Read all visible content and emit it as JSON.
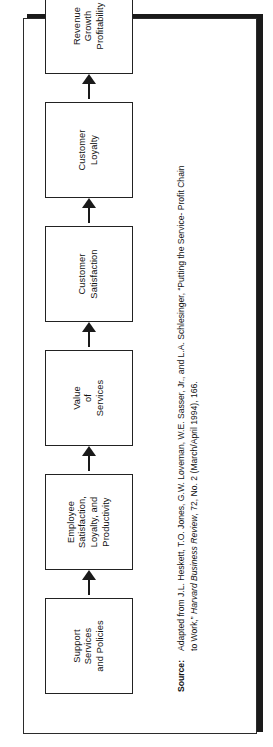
{
  "figure": {
    "orientation": "rotated-90-ccw",
    "frame_border_color": "#2b2b2b",
    "shadow_color": "#1a1a1a",
    "box_border_color": "#222222",
    "arrow_color": "#1a1a1a",
    "background": "#ffffff"
  },
  "diagram": {
    "type": "flow-chain",
    "nodes": [
      {
        "id": "support-services-and-policies",
        "lines": [
          "Support",
          "Services",
          "and Policies"
        ]
      },
      {
        "id": "employee-satisfaction-loyalty-productivity",
        "lines": [
          "Employee",
          "Satisfaction,",
          "Loyalty, and",
          "Productivity"
        ]
      },
      {
        "id": "value-of-services",
        "lines": [
          "Value",
          "of",
          "Services"
        ]
      },
      {
        "id": "customer-satisfaction",
        "lines": [
          "Customer",
          "Satisfaction"
        ]
      },
      {
        "id": "customer-loyalty",
        "lines": [
          "Customer",
          "Loyalty"
        ]
      },
      {
        "id": "revenue-growth-profitability",
        "lines": [
          "Revenue",
          "Growth",
          "Profitability"
        ]
      }
    ],
    "connectors": [
      {
        "from": "support-services-and-policies",
        "to": "employee-satisfaction-loyalty-productivity",
        "glyph": "arrow-right-icon"
      },
      {
        "from": "employee-satisfaction-loyalty-productivity",
        "to": "value-of-services",
        "glyph": "arrow-right-icon"
      },
      {
        "from": "value-of-services",
        "to": "customer-satisfaction",
        "glyph": "arrow-right-icon"
      },
      {
        "from": "customer-satisfaction",
        "to": "customer-loyalty",
        "glyph": "arrow-right-icon"
      },
      {
        "from": "customer-loyalty",
        "to": "revenue-growth-profitability",
        "glyph": "arrow-right-icon"
      }
    ]
  },
  "source": {
    "label": "Source:",
    "line1_a": "Adapted from J.L. Heskett, T.O. Jones, G.W. Loveman, W.E. Sasser, Jr., and L.A. Schlesinger, “Putting the Service- Profit Chain",
    "line2_a": "to Work,” ",
    "line2_italic": "Harvard Business Review",
    "line2_b": ", 72, No. 2 (March/April 1994), 166."
  }
}
